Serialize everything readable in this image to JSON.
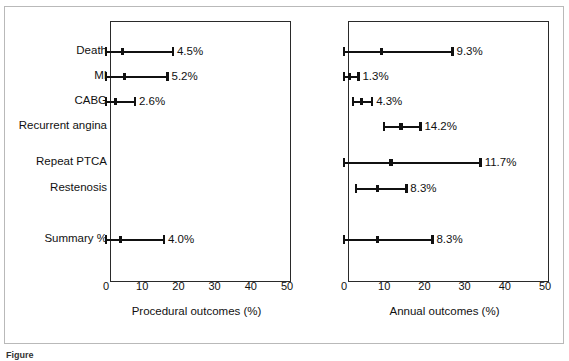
{
  "figure": {
    "caption_fragment": "Figure",
    "rows": [
      "Death",
      "MI",
      "CABG",
      "Recurrent angina",
      "Repeat PTCA",
      "Restenosis",
      "Summary %"
    ]
  },
  "chart_data": [
    {
      "type": "forest",
      "panel": "left",
      "title": "",
      "xlabel": "Procedural outcomes (%)",
      "ylabel": "",
      "xlim": [
        0,
        50
      ],
      "xticks": [
        0,
        10,
        20,
        30,
        40,
        50
      ],
      "xticklabels": [
        "0",
        "10",
        "20",
        "30",
        "40",
        "50"
      ],
      "grid": false,
      "categories": [
        "Death",
        "MI",
        "CABG",
        "Recurrent angina",
        "Repeat PTCA",
        "Restenosis",
        "Summary %"
      ],
      "points": [
        {
          "category": "Death",
          "value": 4.5,
          "label": "4.5%",
          "low": 0.0,
          "high": 18.5,
          "shown": true
        },
        {
          "category": "MI",
          "value": 5.2,
          "label": "5.2%",
          "low": 0.0,
          "high": 17.0,
          "shown": true
        },
        {
          "category": "CABG",
          "value": 2.6,
          "label": "2.6%",
          "low": 0.0,
          "high": 8.0,
          "shown": true
        },
        {
          "category": "Recurrent angina",
          "value": null,
          "label": "",
          "low": null,
          "high": null,
          "shown": false
        },
        {
          "category": "Repeat PTCA",
          "value": null,
          "label": "",
          "low": null,
          "high": null,
          "shown": false
        },
        {
          "category": "Restenosis",
          "value": null,
          "label": "",
          "low": null,
          "high": null,
          "shown": false
        },
        {
          "category": "Summary %",
          "value": 4.0,
          "label": "4.0%",
          "low": 0.0,
          "high": 16.0,
          "shown": true
        }
      ]
    },
    {
      "type": "forest",
      "panel": "right",
      "title": "",
      "xlabel": "Annual outcomes (%)",
      "ylabel": "",
      "xlim": [
        0,
        50
      ],
      "xticks": [
        0,
        10,
        20,
        30,
        40,
        50
      ],
      "xticklabels": [
        "0",
        "10",
        "20",
        "30",
        "40",
        "50"
      ],
      "grid": false,
      "categories": [
        "Death",
        "MI",
        "CABG",
        "Recurrent angina",
        "Repeat PTCA",
        "Restenosis",
        "Summary %"
      ],
      "points": [
        {
          "category": "Death",
          "value": 9.3,
          "label": "9.3%",
          "low": 0.0,
          "high": 27.0,
          "shown": true
        },
        {
          "category": "MI",
          "value": 1.3,
          "label": "1.3%",
          "low": 0.0,
          "high": 3.6,
          "shown": true
        },
        {
          "category": "CABG",
          "value": 4.3,
          "label": "4.3%",
          "low": 2.2,
          "high": 7.0,
          "shown": true
        },
        {
          "category": "Recurrent angina",
          "value": 14.2,
          "label": "14.2%",
          "low": 10.0,
          "high": 19.0,
          "shown": true
        },
        {
          "category": "Repeat PTCA",
          "value": 11.7,
          "label": "11.7%",
          "low": 0.0,
          "high": 34.0,
          "shown": true
        },
        {
          "category": "Restenosis",
          "value": 8.3,
          "label": "8.3%",
          "low": 3.0,
          "high": 15.5,
          "shown": true
        },
        {
          "category": "Summary %",
          "value": 8.3,
          "label": "8.3%",
          "low": 0.0,
          "high": 22.0,
          "shown": true
        }
      ]
    }
  ]
}
